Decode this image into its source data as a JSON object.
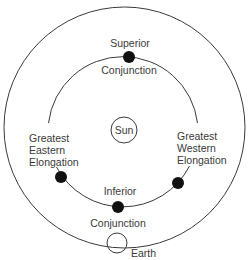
{
  "diagram": {
    "colors": {
      "line": "#3a3a3a",
      "planet": "#111111",
      "background": "#ffffff"
    },
    "bodies": {
      "sun": {
        "label": "Sun"
      },
      "earth": {
        "label": "Earth"
      }
    },
    "positions": {
      "superior_conjunction": {
        "line1": "Superior",
        "line2": "Conjunction"
      },
      "greatest_eastern_elongation": {
        "line1": "Greatest",
        "line2": "Eastern",
        "line3": "Elongation"
      },
      "greatest_western_elongation": {
        "line1": "Greatest",
        "line2": "Western",
        "line3": "Elongation"
      },
      "inferior_conjunction": {
        "line1": "Inferior",
        "line2": "Conjunction"
      }
    }
  }
}
